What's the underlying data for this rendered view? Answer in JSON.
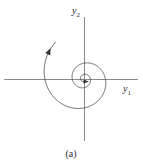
{
  "figure": {
    "caption": "(a)",
    "axes": {
      "x": {
        "label_base": "y",
        "label_sub": "1",
        "name": "y1"
      },
      "y": {
        "label_base": "y",
        "label_sub": "2",
        "name": "y2"
      }
    },
    "colors": {
      "background": "#ffffff",
      "axis": "#8a8a8a",
      "trajectory": "#4a4a4a",
      "arrow": "#333333",
      "text": "#2b2b2b"
    }
  },
  "chart_data": {
    "type": "line",
    "title": "",
    "subtitle": "",
    "xlabel": "y1",
    "ylabel": "y2",
    "annotations": [
      "(a)"
    ],
    "legend": [],
    "grid": false,
    "xlim": [
      -1.25,
      1.25
    ],
    "ylim": [
      -1.25,
      1.25
    ],
    "series": [
      {
        "name": "spiral-trajectory",
        "kind": "parametric-spiral",
        "direction": "clockwise-inward",
        "converges_to": [
          0,
          0
        ],
        "theta_start_deg": 128,
        "theta_end_deg": 1010,
        "r_start": 1.15,
        "r_end": 0.06,
        "decay": 0.78,
        "arrow_positions": [
          0.02,
          0.965
        ]
      }
    ]
  },
  "geometry": {
    "center": {
      "x": 84,
      "y": 79
    },
    "x_axis": {
      "x1": 4,
      "x2": 138,
      "y": 79
    },
    "y_axis": {
      "x": 84,
      "y1": 17,
      "y2": 141
    },
    "x_label_pos": {
      "x": 123,
      "y": 92
    },
    "y_label_pos": {
      "x": 72,
      "y": 14
    },
    "caption_pos": {
      "x": 71,
      "y": 156
    }
  }
}
